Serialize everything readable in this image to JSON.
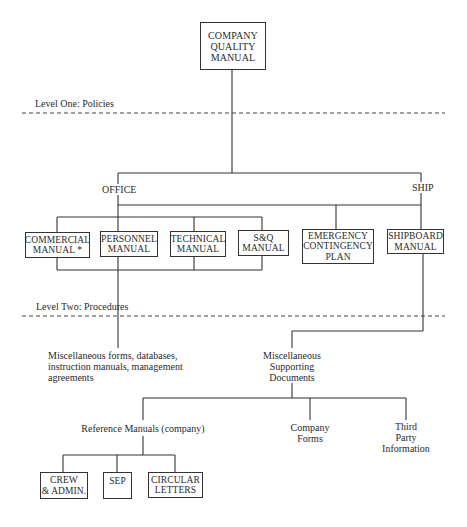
{
  "diagram": {
    "type": "organization-chart",
    "title_box": "COMPANY\nQUALITY\nMANUAL",
    "levels": [
      {
        "label": "Level One: Policies"
      },
      {
        "label": "Level Two: Procedures"
      }
    ],
    "branches": {
      "office": "OFFICE",
      "ship": "SHIP"
    },
    "office_manuals": [
      {
        "label": "COMMERCIAL\nMANUAL *"
      },
      {
        "label": "PERSONNEL\nMANUAL"
      },
      {
        "label": "TECHNICAL\nMANUAL"
      },
      {
        "label": "S&Q\nMANUAL"
      }
    ],
    "emergency_plan": "EMERGENCY\nCONTINGENCY\nPLAN",
    "shipboard_manual": "SHIPBOARD\nMANUAL",
    "office_procedures": "Miscellaneous forms, databases,\ninstruction manuals, management\nagreements",
    "supporting_documents": "Miscellaneous\nSupporting\nDocuments",
    "supporting_children": [
      {
        "label": "Reference Manuals (company)"
      },
      {
        "label": "Company\nForms"
      },
      {
        "label": "Third\nParty\nInformation"
      }
    ],
    "reference_manuals": [
      {
        "label": "CREW\n& ADMIN."
      },
      {
        "label": "SEP"
      },
      {
        "label": "CIRCULAR\nLETTERS"
      }
    ]
  }
}
